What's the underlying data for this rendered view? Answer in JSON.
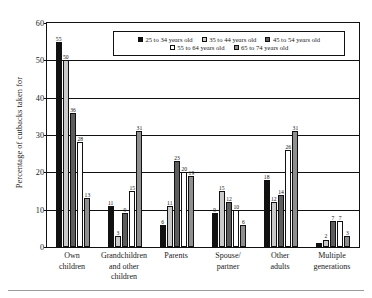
{
  "chart_data": {
    "type": "bar",
    "title": "",
    "subtitle": "",
    "xlabel": "",
    "ylabel": "Percentage of cutbacks taken for",
    "ylim": [
      0,
      60
    ],
    "ytick_step": 10,
    "yticks": [
      "0",
      "10",
      "20",
      "30",
      "40",
      "50",
      "60"
    ],
    "grid": true,
    "legend_position": "top-center-inside",
    "categories": [
      "Own children",
      "Grandchildren and other children",
      "Parents",
      "Spouse/ partner",
      "Other adults",
      "Multiple generations"
    ],
    "category_lines": [
      [
        "Own",
        "children"
      ],
      [
        "Grandchildren",
        "and other",
        "children"
      ],
      [
        "Parents"
      ],
      [
        "Spouse/",
        "partner"
      ],
      [
        "Other",
        "adults"
      ],
      [
        "Multiple",
        "generations"
      ]
    ],
    "series": [
      {
        "name": "25 to 34 years old",
        "color": "#111111",
        "values": [
          55,
          11,
          6,
          9,
          18,
          1
        ],
        "labels": [
          "55",
          "11",
          "6",
          "9",
          "18",
          ""
        ]
      },
      {
        "name": "35 to 44 years old",
        "color": "#c9c9c9",
        "values": [
          50,
          3,
          11,
          15,
          12,
          2
        ],
        "labels": [
          "50",
          "3",
          "11",
          "15",
          "12",
          "2"
        ]
      },
      {
        "name": "45 to 54 years old",
        "color": "#5d5d5d",
        "values": [
          36,
          9,
          23,
          12,
          14,
          7
        ],
        "labels": [
          "36",
          "9",
          "23",
          "12",
          "14",
          "7"
        ]
      },
      {
        "name": "55 to 64 years old",
        "color": "#ffffff",
        "values": [
          28,
          15,
          20,
          10,
          26,
          7
        ],
        "labels": [
          "28",
          "15",
          "20",
          "10",
          "26",
          "7"
        ]
      },
      {
        "name": "65 to 74 years old",
        "color": "#8f8f8f",
        "values": [
          13,
          31,
          19,
          6,
          31,
          3
        ],
        "labels": [
          "13",
          "31",
          "19",
          "6",
          "31",
          "3"
        ]
      }
    ]
  }
}
